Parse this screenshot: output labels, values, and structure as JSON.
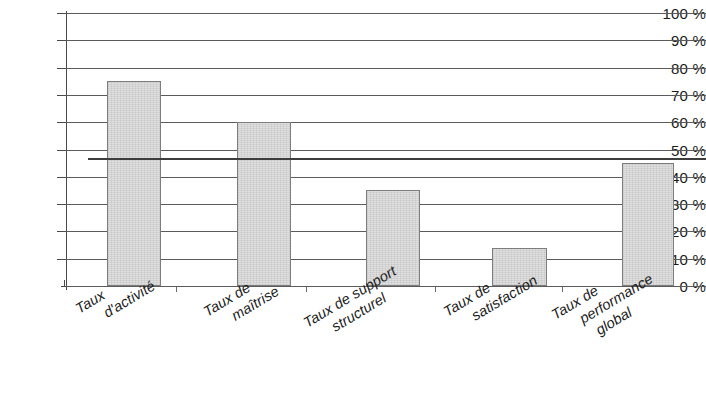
{
  "chart_data": {
    "type": "bar",
    "title": "",
    "subtitle": "",
    "xlabel": "",
    "ylabel": "",
    "categories": [
      "Taux d'activité",
      "Taux de maîtrise",
      "Taux de support structurel",
      "Taux de satisfaction",
      "Taux de performance global"
    ],
    "category_lines": [
      [
        "Taux",
        "d'activité"
      ],
      [
        "Taux de",
        "maîtrise"
      ],
      [
        "Taux de support",
        "structurel"
      ],
      [
        "Taux de",
        "satisfaction"
      ],
      [
        "Taux de",
        "performance",
        "global"
      ]
    ],
    "values": [
      75,
      60,
      35,
      14,
      45
    ],
    "value_unit": "%",
    "ylim": [
      0,
      100
    ],
    "ytick_values": [
      0,
      10,
      20,
      30,
      40,
      50,
      60,
      70,
      80,
      90,
      100
    ],
    "ytick_labels": [
      "0 %",
      "10 %",
      "20 %",
      "30 %",
      "40 %",
      "50 %",
      "60 %",
      "70 %",
      "80 %",
      "90 %",
      "100 %"
    ],
    "grid": true,
    "grid_axis": "y",
    "legend": false,
    "legend_position": "none",
    "annotations": [
      {
        "type": "reference-line",
        "orientation": "horizontal",
        "value": 47,
        "label": ""
      }
    ],
    "bar_fill_color": "#e0e0e0",
    "bar_border_color": "#7d7d7d",
    "axis_color": "#4a4a4a",
    "grid_color": "#5b5b5b",
    "reference_line_color": "#3d3d3d",
    "background_color": "#ffffff",
    "label_rotation_degrees": -31
  }
}
